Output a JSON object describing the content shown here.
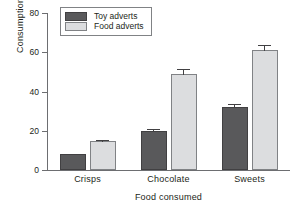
{
  "chart_data": {
    "type": "bar",
    "title": "",
    "xlabel": "Food consumed",
    "ylabel": "Consumption (g)",
    "categories": [
      "Crisps",
      "Chocolate",
      "Sweets"
    ],
    "ylim": [
      0,
      80
    ],
    "yticks": [
      0,
      20,
      40,
      60,
      80
    ],
    "ytick_labels": [
      "0",
      "20",
      "40",
      "60",
      "80"
    ],
    "grid": false,
    "legend_position": "top-left",
    "series": [
      {
        "name": "Toy adverts",
        "color": "#59595b",
        "values": [
          8,
          20,
          32
        ],
        "errors": [
          0.8,
          1.5,
          2.0
        ]
      },
      {
        "name": "Food adverts",
        "color": "#dcdddf",
        "values": [
          15,
          49,
          61
        ],
        "errors": [
          0.8,
          3.0,
          3.0
        ]
      }
    ]
  }
}
